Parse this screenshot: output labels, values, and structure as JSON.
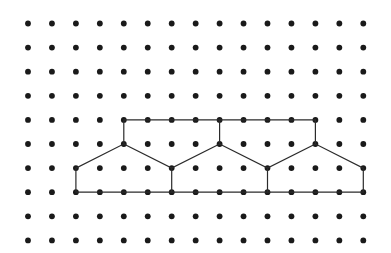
{
  "figure": {
    "background_color": "#ffffff",
    "dot_color": "#1a1a1a",
    "line_color": "#2b2b2b",
    "dot_radius": 2.9,
    "line_width": 1.2,
    "grid": {
      "columns": 15,
      "rows": 10,
      "origin_x": 28,
      "origin_y": 23.5,
      "spacing_x": 23.95,
      "spacing_y": 24.1
    }
  },
  "chart_data": {
    "type": "scatter",
    "xlabel": "",
    "ylabel": "",
    "grid": true,
    "legend": "none",
    "xlim": [
      0,
      14
    ],
    "ylim": [
      0,
      9
    ],
    "points": {
      "x": [
        0,
        1,
        2,
        3,
        4,
        5,
        6,
        7,
        8,
        9,
        10,
        11,
        12,
        13,
        14
      ],
      "y": [
        0,
        1,
        2,
        3,
        4,
        5,
        6,
        7,
        8,
        9
      ],
      "note": "full cartesian product of x and y is plotted, 150 dots total"
    },
    "series": [
      {
        "name": "polygon-outline",
        "type": "closed-polyline",
        "closed": true,
        "vertices_grid": [
          [
            2,
            7
          ],
          [
            2,
            6
          ],
          [
            4,
            5
          ],
          [
            4,
            4
          ],
          [
            12,
            4
          ],
          [
            12,
            5
          ],
          [
            14,
            6
          ],
          [
            14,
            7
          ]
        ],
        "vertices_label": "bottom-left, left-shoulder, peak-1-base, peak-1-top, peak-3-top, peak-3-base, right-shoulder, bottom-right"
      },
      {
        "name": "valley-chevron-1",
        "type": "polyline",
        "closed": false,
        "vertices_grid": [
          [
            4,
            5
          ],
          [
            6,
            6
          ],
          [
            8,
            5
          ]
        ]
      },
      {
        "name": "valley-stem-1",
        "type": "segment",
        "vertices_grid": [
          [
            6,
            6
          ],
          [
            6,
            7
          ]
        ]
      },
      {
        "name": "peak-2-stem",
        "type": "segment",
        "vertices_grid": [
          [
            8,
            5
          ],
          [
            8,
            4
          ]
        ]
      },
      {
        "name": "valley-chevron-2",
        "type": "polyline",
        "closed": false,
        "vertices_grid": [
          [
            8,
            5
          ],
          [
            10,
            6
          ],
          [
            12,
            5
          ]
        ]
      },
      {
        "name": "valley-stem-2",
        "type": "segment",
        "vertices_grid": [
          [
            10,
            6
          ],
          [
            10,
            7
          ]
        ]
      }
    ]
  }
}
